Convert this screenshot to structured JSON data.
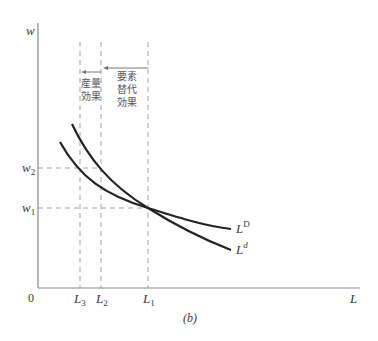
{
  "figure": {
    "caption": "(b)",
    "y_axis_label": "w",
    "x_axis_label": "L",
    "origin_label": "0",
    "y_ticks": [
      {
        "base": "w",
        "sub": "2",
        "id": "w2"
      },
      {
        "base": "w",
        "sub": "1",
        "id": "w1"
      }
    ],
    "x_ticks": [
      {
        "base": "L",
        "sub": "3",
        "id": "L3"
      },
      {
        "base": "L",
        "sub": "2",
        "id": "L2"
      },
      {
        "base": "L",
        "sub": "1",
        "id": "L1"
      }
    ],
    "curves": [
      {
        "base": "L",
        "sup": "D",
        "id": "LD",
        "description": "flatter labor demand curve"
      },
      {
        "base": "L",
        "sup": "d",
        "id": "Ld",
        "description": "steeper labor demand curve"
      }
    ],
    "annotations": {
      "output_effect": {
        "line1": "産量",
        "line2": "効果"
      },
      "substitution_effect": {
        "line1": "要素",
        "line2": "替代",
        "line3": "効果"
      }
    },
    "colors": {
      "curve": "#222222",
      "axis": "#888888",
      "guide": "#999999",
      "text": "#3a3a3a"
    }
  }
}
